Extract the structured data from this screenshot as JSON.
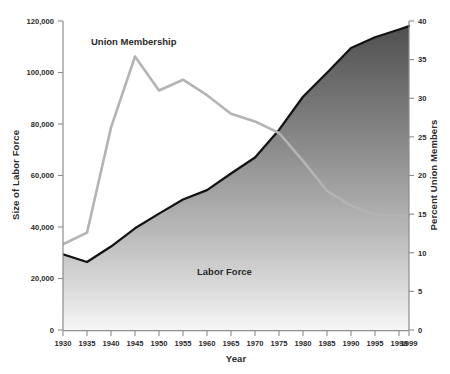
{
  "chart_data": {
    "type": "area",
    "title": "",
    "xlabel": "Year",
    "ylabel": "Size of Labor Force",
    "y2label": "Percent Union Members",
    "grid": false,
    "legend": "inline-annotations",
    "xlim": [
      1930,
      1999
    ],
    "ylim": [
      0,
      120000
    ],
    "y2lim": [
      0,
      40
    ],
    "x_tick_labels": [
      "1930",
      "1935",
      "1940",
      "1945",
      "1950",
      "1955",
      "1960",
      "1965",
      "1970",
      "1975",
      "1980",
      "1985",
      "1990",
      "1995",
      "1998",
      "1999"
    ],
    "y_tick_labels": [
      "0",
      "20,000",
      "40,000",
      "60,000",
      "80,000",
      "100,000",
      "120,000"
    ],
    "y_tick_values": [
      0,
      20000,
      40000,
      60000,
      80000,
      100000,
      120000
    ],
    "y2_tick_labels": [
      "0",
      "5",
      "10",
      "15",
      "20",
      "25",
      "30",
      "35",
      "40"
    ],
    "y2_tick_values": [
      0,
      5,
      10,
      15,
      20,
      25,
      30,
      35,
      40
    ],
    "categories": [
      1930,
      1935,
      1940,
      1945,
      1950,
      1955,
      1960,
      1965,
      1970,
      1975,
      1980,
      1985,
      1990,
      1995,
      1998,
      1999
    ],
    "series": [
      {
        "name": "Labor Force",
        "axis": "left",
        "unit": "thousands of workers",
        "style": "filled-area-gradient",
        "label_text": "Labor Force",
        "values": [
          29400,
          26400,
          32400,
          39500,
          45200,
          50700,
          54300,
          60800,
          67000,
          77700,
          90600,
          99900,
          109500,
          113700,
          116700,
          118000
        ]
      },
      {
        "name": "Union Membership",
        "axis": "right",
        "unit": "percent of labor force",
        "style": "line",
        "label_text": "Union Membership",
        "values": [
          11.1,
          12.6,
          26.2,
          35.4,
          31.0,
          32.4,
          30.4,
          28.0,
          27.0,
          25.5,
          21.9,
          18.0,
          16.1,
          14.9,
          14.8,
          14.8
        ],
        "values_equivalent_left_scale": [
          33300,
          37800,
          78600,
          106200,
          93000,
          97200,
          91200,
          84000,
          81000,
          76500,
          65700,
          54000,
          48300,
          44700,
          44400,
          44400
        ]
      }
    ],
    "annotations": [
      {
        "text": "Union Membership",
        "x": 1942,
        "y_axis": "right",
        "note": "label above union line"
      },
      {
        "text": "Labor Force",
        "x": 1962,
        "y_axis": "left",
        "note": "label inside shaded area"
      }
    ],
    "colors": {
      "union_line": "#b3b3b3",
      "labor_force_outline": "#1a1a1a",
      "labor_force_fill_top": "#4a4a4a",
      "labor_force_fill_bottom": "#f2f2f2",
      "axis": "#8d8d8d",
      "text": "#2b2b2b",
      "background": "#ffffff"
    }
  }
}
